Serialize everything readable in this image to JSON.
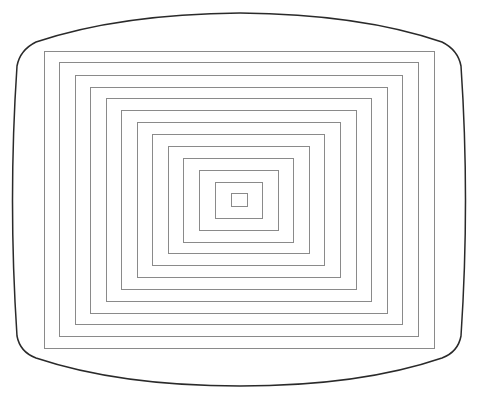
{
  "figure": {
    "background": "#ffffff",
    "bezel": {
      "stroke": "#2a2a2a",
      "stroke_width": 1.5
    },
    "rect_stroke": "#8a8a8a",
    "rect_stroke_width": 1,
    "rectangles": [
      {
        "x1": 44,
        "y1": 51,
        "x2": 434,
        "y2": 348
      },
      {
        "x1": 59,
        "y1": 62,
        "x2": 418,
        "y2": 336
      },
      {
        "x1": 75,
        "y1": 75,
        "x2": 402,
        "y2": 324
      },
      {
        "x1": 90,
        "y1": 87,
        "x2": 387,
        "y2": 313
      },
      {
        "x1": 106,
        "y1": 98,
        "x2": 371,
        "y2": 301
      },
      {
        "x1": 121,
        "y1": 110,
        "x2": 356,
        "y2": 289
      },
      {
        "x1": 137,
        "y1": 122,
        "x2": 340,
        "y2": 277
      },
      {
        "x1": 152,
        "y1": 134,
        "x2": 324,
        "y2": 265
      },
      {
        "x1": 168,
        "y1": 146,
        "x2": 309,
        "y2": 253
      },
      {
        "x1": 183,
        "y1": 158,
        "x2": 293,
        "y2": 242
      },
      {
        "x1": 199,
        "y1": 170,
        "x2": 278,
        "y2": 230
      },
      {
        "x1": 215,
        "y1": 182,
        "x2": 262,
        "y2": 218
      },
      {
        "x1": 231,
        "y1": 193,
        "x2": 247,
        "y2": 206
      }
    ]
  }
}
